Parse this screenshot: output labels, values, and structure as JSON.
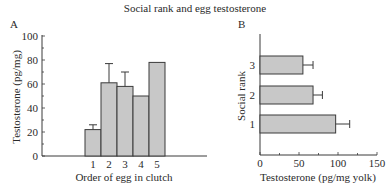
{
  "figure": {
    "title": "Social rank and egg testosterone",
    "panels": [
      "A",
      "B"
    ]
  },
  "colors": {
    "bar_fill": "#c8c8c8",
    "bar_stroke": "#3a3a3a",
    "axis": "#3a3a3a"
  },
  "chart_data": [
    {
      "panel": "A",
      "type": "bar",
      "orientation": "vertical",
      "title": "",
      "xlabel": "Order of egg in clutch",
      "ylabel": "Testosterone (pg/mg)",
      "categories": [
        "1",
        "2",
        "3",
        "4",
        "5"
      ],
      "values": [
        22,
        61,
        58,
        50,
        78
      ],
      "error_upper": [
        26,
        77,
        70,
        null,
        null
      ],
      "ylim": [
        0,
        100
      ],
      "yticks": [
        "0",
        "20",
        "40",
        "60",
        "80",
        "100"
      ],
      "grid": false
    },
    {
      "panel": "B",
      "type": "bar",
      "orientation": "horizontal",
      "title": "",
      "xlabel": "Testosterone (pg/mg yolk)",
      "ylabel": "Social rank",
      "categories": [
        "1",
        "2",
        "3"
      ],
      "values": [
        97,
        68,
        55
      ],
      "error_upper": [
        115,
        80,
        68
      ],
      "xlim": [
        0,
        150
      ],
      "xticks": [
        "0",
        "50",
        "100",
        "150"
      ],
      "grid": false
    }
  ]
}
